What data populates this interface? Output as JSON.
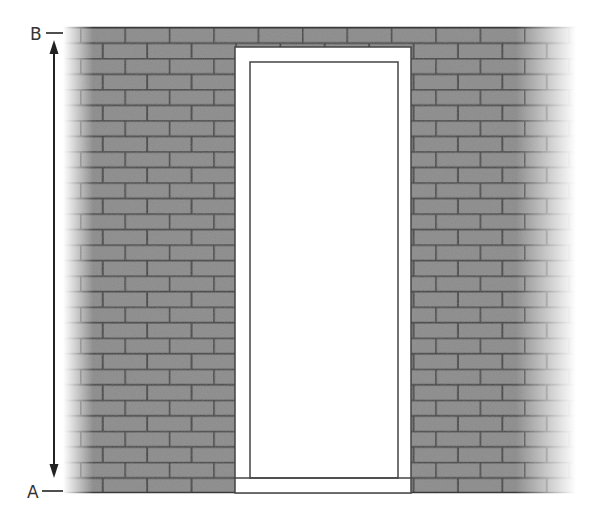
{
  "diagram": {
    "labels": {
      "top": "B",
      "bottom": "A"
    },
    "colors": {
      "brick": "#8a8a8a",
      "mortar": "#3a3a3a",
      "door_fill": "#ffffff",
      "door_outline": "#444444",
      "arrow": "#222222",
      "background": "#ffffff"
    },
    "wall": {
      "left": 62,
      "right": 580,
      "top": 27,
      "bottom": 493,
      "row_height": 15.53,
      "brick_width": 44.4,
      "rows": 30
    },
    "door": {
      "outer_frame": {
        "x": 235,
        "y": 47,
        "width": 176,
        "height": 446
      },
      "inner_panel": {
        "x": 250,
        "y": 62,
        "width": 148,
        "height": 416
      }
    },
    "dimension_arrow": {
      "x": 54,
      "y_top": 40,
      "y_bottom": 478,
      "from_label": "A",
      "to_label": "B"
    }
  }
}
